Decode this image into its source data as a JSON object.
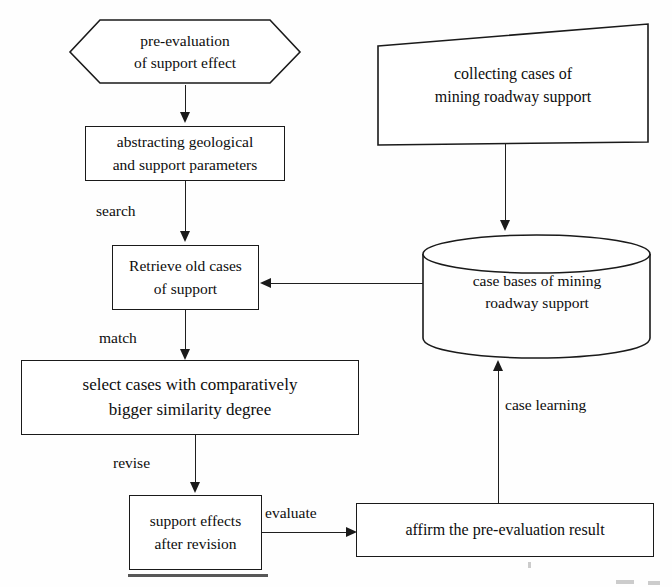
{
  "diagram": {
    "background_color": "#fefefe",
    "line_color": "#1a1a1a",
    "text_color": "#0d0d0d",
    "nodes": {
      "pre_evaluation": {
        "shape": "hexagon",
        "line1": "pre-evaluation",
        "line2": "of support effect"
      },
      "abstracting": {
        "shape": "rectangle",
        "line1": "abstracting geological",
        "line2": "and support parameters"
      },
      "retrieve": {
        "shape": "rectangle",
        "line1": "Retrieve old cases",
        "line2": "of support"
      },
      "select_cases": {
        "shape": "rectangle",
        "line1": "select cases with comparatively",
        "line2": "bigger similarity degree"
      },
      "support_effects": {
        "shape": "rectangle",
        "line1": "support effects",
        "line2": "after revision"
      },
      "affirm": {
        "shape": "rectangle",
        "line1": "affirm the pre-evaluation result"
      },
      "collecting": {
        "shape": "skewed-rectangle",
        "line1": "collecting cases of",
        "line2": "mining roadway support"
      },
      "case_bases": {
        "shape": "cylinder",
        "line1": "case bases of mining",
        "line2": "roadway support"
      }
    },
    "edge_labels": {
      "search": "search",
      "match": "match",
      "revise": "revise",
      "evaluate": "evaluate",
      "case_learning": "case learning"
    }
  }
}
